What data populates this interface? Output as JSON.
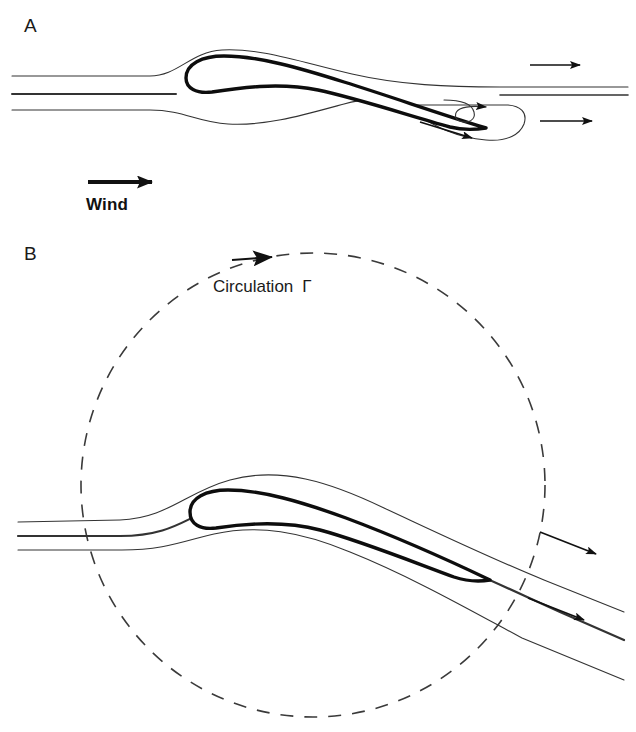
{
  "figure": {
    "background_color": "#ffffff",
    "ink_color": "#1a1a1a",
    "width": 636,
    "height": 732
  },
  "panels": [
    {
      "id": "A",
      "label": "A",
      "caption_labels": [
        {
          "name": "wind",
          "text": "Wind"
        }
      ],
      "elements": [
        "airfoil-cross-section",
        "upper-streamline",
        "stagnation-streamline",
        "lower-streamline",
        "starting-vortex",
        "flow-arrow-upper-right",
        "flow-arrow-lower-right",
        "flow-arrow-vortex",
        "flow-arrow-under-wing",
        "wind-arrow"
      ]
    },
    {
      "id": "B",
      "label": "B",
      "caption_labels": [
        {
          "name": "circulation",
          "text": "Circulation",
          "symbol": "Γ"
        }
      ],
      "elements": [
        "circulation-circle-dashed",
        "circulation-arrowhead",
        "airfoil-cross-section",
        "upper-streamline",
        "stagnation-streamline",
        "lower-streamline",
        "flow-arrow-upper-right",
        "flow-arrow-lower-right"
      ]
    }
  ],
  "labels": {
    "panel_a": "A",
    "panel_b": "B",
    "wind": "Wind",
    "circulation": "Circulation",
    "gamma": "Γ"
  },
  "style": {
    "stream_stroke": "#333333",
    "stream_width": 1.1,
    "stagnation_width": 2.0,
    "airfoil_stroke": "#0d0d0d",
    "airfoil_width": 3.4,
    "dash_stroke": "#3a3a3a",
    "dash_width": 1.6,
    "dash_pattern": "13 11",
    "arrow_color": "#111111"
  }
}
